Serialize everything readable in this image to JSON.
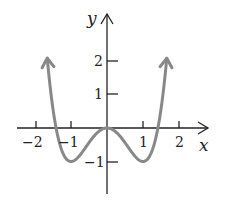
{
  "chart_data": {
    "type": "line",
    "title": "",
    "function": "y = x^4 - 2x^2",
    "xlabel": "x",
    "ylabel": "y",
    "xlim": [
      -2.3,
      2.6
    ],
    "ylim": [
      -2,
      3.2
    ],
    "x_ticks": [
      -2,
      -1,
      1,
      2
    ],
    "y_ticks": [
      2,
      1,
      -1
    ],
    "x_tick_labels": [
      "−2",
      "−1",
      "1",
      "2"
    ],
    "y_tick_labels": [
      "2",
      "1",
      "−1"
    ],
    "grid": false,
    "legend": null,
    "series": [
      {
        "name": "curve",
        "color": "#888888",
        "x": [
          -1.7,
          -1.5,
          -1.414,
          -1.25,
          -1.0,
          -0.75,
          -0.5,
          -0.25,
          0,
          0.25,
          0.5,
          0.75,
          1.0,
          1.25,
          1.414,
          1.5,
          1.7
        ],
        "y": [
          2.57,
          0.56,
          0.0,
          -0.68,
          -1.0,
          -0.81,
          -0.44,
          -0.12,
          0,
          -0.12,
          -0.44,
          -0.81,
          -1.0,
          -0.68,
          0.0,
          0.56,
          2.57
        ]
      }
    ],
    "key_points": {
      "local_max": [
        0,
        0
      ],
      "local_min": [
        [
          -1,
          -1
        ],
        [
          1,
          -1
        ]
      ],
      "x_intercepts": [
        -1.414,
        0,
        1.414
      ]
    }
  },
  "labels": {
    "x_axis": "x",
    "y_axis": "y",
    "xt_m2": "−2",
    "xt_m1": "−1",
    "xt_1": "1",
    "xt_2": "2",
    "yt_2": "2",
    "yt_1": "1",
    "yt_m1": "−1"
  },
  "colors": {
    "curve": "#888888",
    "axes": "#222222"
  }
}
